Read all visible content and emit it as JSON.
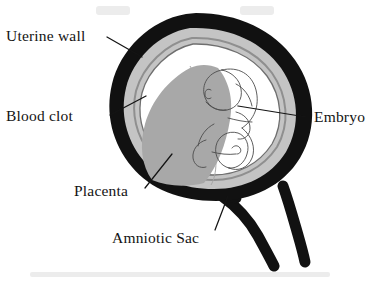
{
  "figure": {
    "background_color": "#ffffff"
  },
  "labels": {
    "uterine_wall": "Uterine wall",
    "blood_clot": "Blood clot",
    "placenta": "Placenta",
    "amniotic_sac": "Amniotic Sac",
    "embryo": "Embryo"
  },
  "colors": {
    "outline_black": "#111111",
    "uterine_wall": "#111111",
    "blood_clot_gray": "#c4c4c4",
    "placenta_gray": "#a8a8a8",
    "membrane_gray": "#8f8f8f",
    "amniotic_fluid": "#ffffff",
    "embryo_line": "#4c4c4c",
    "label_text": "#141414",
    "leader_line": "#141414",
    "scan_smudge": "#ececec"
  },
  "structures": [
    {
      "name": "uterine-wall",
      "label": "Uterine wall",
      "fill": "#111111",
      "description": "thick black outer muscular wall, pear shaped"
    },
    {
      "name": "blood-clot",
      "label": "Blood clot",
      "fill": "#c4c4c4",
      "description": "light gray layer lining inside of uterine wall"
    },
    {
      "name": "amniotic-sac",
      "label": "Amniotic Sac",
      "fill": "#ffffff",
      "description": "thin membrane ring enclosing clear fluid around embryo"
    },
    {
      "name": "placenta",
      "label": "Placenta",
      "fill": "#a8a8a8",
      "description": "medium gray wedge on lower left of uterine cavity"
    },
    {
      "name": "embryo",
      "label": "Embryo",
      "fill": "#ffffff",
      "description": "curled line-drawn embryo with head, limb buds and yolk sac"
    },
    {
      "name": "cervical-canal",
      "label": "",
      "fill": "#111111",
      "description": "black Y shaped canal extending down and right from uterus"
    }
  ]
}
